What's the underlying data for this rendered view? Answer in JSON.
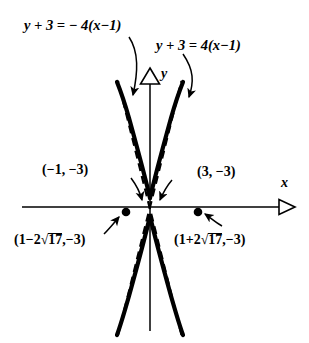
{
  "figure": {
    "kind": "hyperbola-graph",
    "background": "#ffffff",
    "ink": "#000000",
    "axes": {
      "x_label": "x",
      "y_label": "y",
      "x_axis_name": "x-axis",
      "y_axis_name": "y-axis",
      "arrowhead": "hollow-triangle",
      "origin_px": [
        150,
        207
      ]
    },
    "equations": {
      "left": {
        "lhs": "y + 3 = ",
        "rhs": "− 4(x−1)",
        "full": "y + 3 = − 4(x−1)",
        "role": "asymptote-negative-slope"
      },
      "right": {
        "lhs": "y + 3 = ",
        "rhs": "4(x−1)",
        "full": "y + 3 = 4(x−1)",
        "role": "asymptote-positive-slope"
      }
    },
    "vertex_labels": {
      "left": "(−1, −3)",
      "right": "(3, −3)"
    },
    "focus_labels": {
      "left_prefix": "(1−2",
      "left_radicand": "17",
      "left_suffix": ",−3)",
      "left_full": "(1−2√17,−3)",
      "right_prefix": "(1+2",
      "right_radicand": "17",
      "right_suffix": ",−3)",
      "right_full": "(1+2√17,−3)"
    },
    "radical_glyph": "√",
    "markers": {
      "focus_left_px": [
        126,
        212
      ],
      "focus_right_px": [
        198,
        212
      ],
      "style": "filled-dot"
    },
    "curves": {
      "branch_style": "solid-thick",
      "asymptote_style": "dashed",
      "opening": "up-down",
      "slope_magnitude": 4
    }
  }
}
